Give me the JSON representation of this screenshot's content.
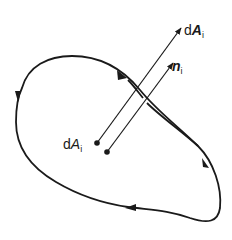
{
  "diagram": {
    "type": "closed-curve-surface-element",
    "stroke_color": "#1a1a1a",
    "background": "#ffffff",
    "labels": {
      "area_vector": {
        "prefix": "d",
        "symbol": "A",
        "subscript": "i",
        "style": "bold-italic"
      },
      "normal_vector": {
        "prefix": "",
        "symbol": "n",
        "subscript": "i",
        "style": "bold-italic"
      },
      "area_element": {
        "prefix": "d",
        "symbol": "A",
        "subscript": "i",
        "style": "italic"
      }
    },
    "elements": [
      {
        "name": "boundary-curve",
        "kind": "closed-curve",
        "direction_arrows": 4
      },
      {
        "name": "area-vector-arrow",
        "from": [
          97,
          143
        ],
        "to": [
          182,
          27
        ]
      },
      {
        "name": "normal-vector-arrow",
        "from": [
          107,
          152
        ],
        "to": [
          174,
          62
        ]
      },
      {
        "name": "area-element-point",
        "at": [
          97,
          143
        ]
      },
      {
        "name": "normal-origin-point",
        "at": [
          107,
          152
        ]
      }
    ]
  }
}
